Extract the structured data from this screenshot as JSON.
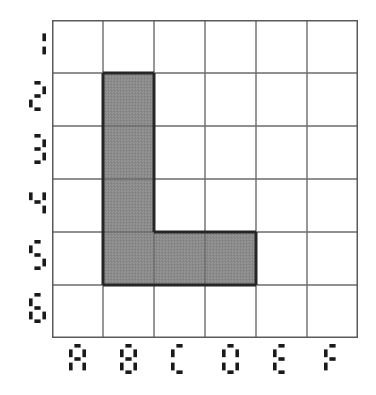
{
  "figure": {
    "title": "",
    "background_color": "#ffffff"
  },
  "grid": {
    "columns": [
      "A",
      "B",
      "C",
      "D",
      "E",
      "F"
    ],
    "rows": [
      "1",
      "2",
      "3",
      "4",
      "5",
      "6"
    ],
    "n_cols": 6,
    "n_rows": 6,
    "line_color": "#6b6b6b",
    "border_color": "#5a5a5a",
    "cell_width": 51,
    "cell_height": 53
  },
  "chart_data": {
    "type": "heatmap",
    "title": "",
    "xlabel": "",
    "ylabel": "",
    "categories": [
      "A",
      "B",
      "C",
      "D",
      "E",
      "F"
    ],
    "rows": [
      "1",
      "2",
      "3",
      "4",
      "5",
      "6"
    ],
    "grid": true,
    "legend": "none",
    "shaded_cells": [
      "B2",
      "B3",
      "B4",
      "B5",
      "C5",
      "D5"
    ],
    "shaded_count": 6,
    "fill_color": "#8a8a8a",
    "outline_color": "#262626",
    "values": [
      [
        0,
        0,
        0,
        0,
        0,
        0
      ],
      [
        0,
        1,
        0,
        0,
        0,
        0
      ],
      [
        0,
        1,
        0,
        0,
        0,
        0
      ],
      [
        0,
        1,
        0,
        0,
        0,
        0
      ],
      [
        0,
        1,
        1,
        1,
        0,
        0
      ],
      [
        0,
        0,
        0,
        0,
        0,
        0
      ]
    ]
  }
}
